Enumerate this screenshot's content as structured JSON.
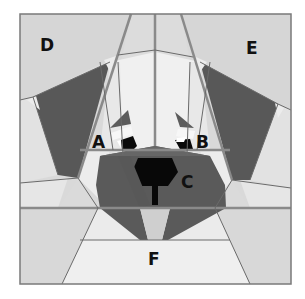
{
  "diagram": {
    "type": "quilt-block-pattern",
    "colors": {
      "background": "#ffffff",
      "light_fabric": "#eeeeee",
      "medium_fabric": "#d6d6d6",
      "mid_light_fabric": "#e4e4e4",
      "dark_fabric": "#5a5a5a",
      "nose_black": "#0a0a0a",
      "seam_line_thick": "#8c8c8c",
      "seam_line_thin": "#6e6e6e",
      "label_color": "#111111"
    },
    "sections": [
      {
        "id": "A",
        "label": "A",
        "description": "left eye unit"
      },
      {
        "id": "B",
        "label": "B",
        "description": "right eye unit"
      },
      {
        "id": "C",
        "label": "C",
        "description": "muzzle and nose unit"
      },
      {
        "id": "D",
        "label": "D",
        "description": "upper-left ear unit"
      },
      {
        "id": "E",
        "label": "E",
        "description": "upper-right ear unit"
      },
      {
        "id": "F",
        "label": "F",
        "description": "bottom chin unit"
      }
    ]
  }
}
